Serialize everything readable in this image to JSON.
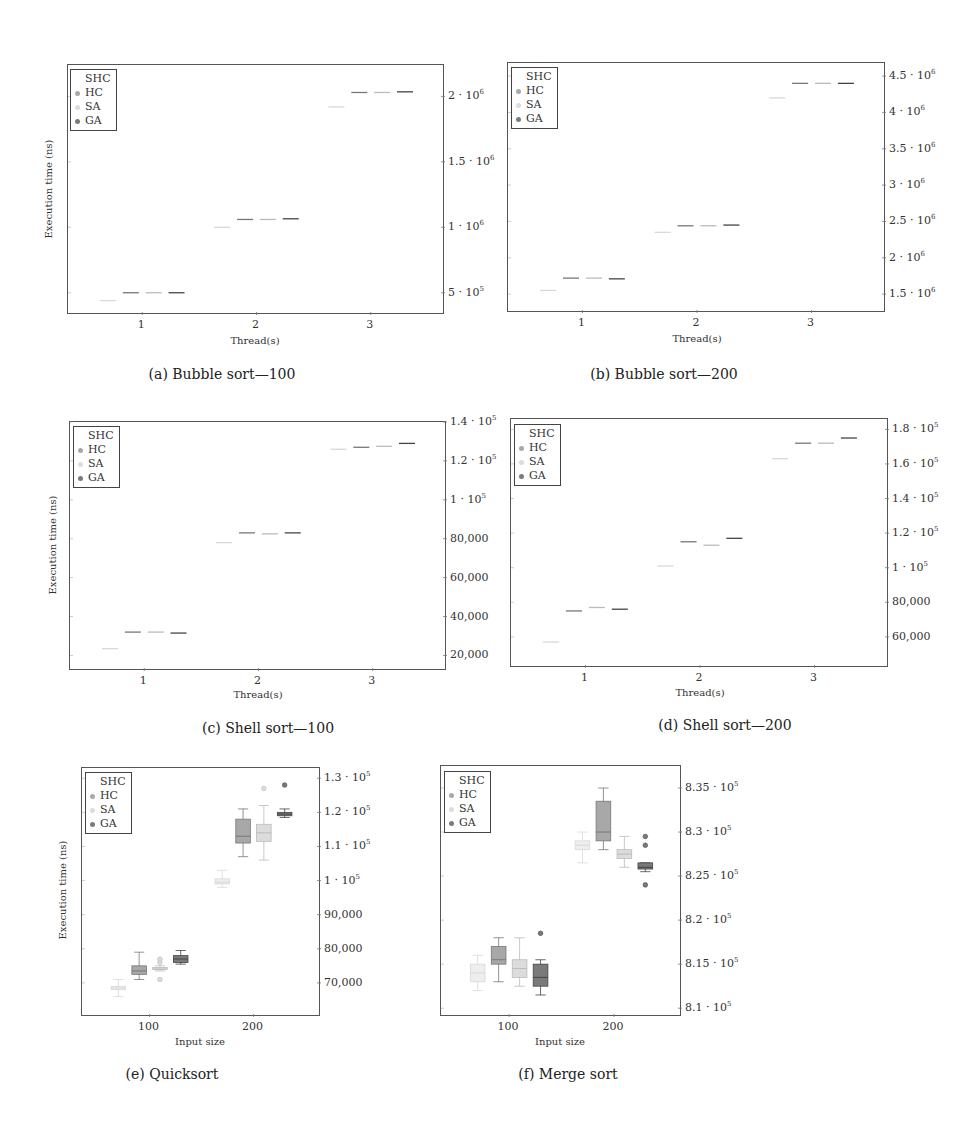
{
  "legend": {
    "title": "SHC",
    "items": [
      {
        "label": "HC",
        "color": "#a8a8a8"
      },
      {
        "label": "SA",
        "color": "#dcdcdc"
      },
      {
        "label": "GA",
        "color": "#7a7a7a"
      }
    ]
  },
  "shc_color": "#eeeeee",
  "chart_data": [
    {
      "id": "a",
      "type": "box",
      "caption": "(a) Bubble sort—100",
      "xlabel": "Thread(s)",
      "ylabel": "Execution time (ns)",
      "categories": [
        "1",
        "2",
        "3"
      ],
      "yticks": [
        {
          "v": 500000,
          "label": "5 · 10",
          "exp": "5"
        },
        {
          "v": 1000000,
          "label": "1 · 10",
          "exp": "6"
        },
        {
          "v": 1500000,
          "label": "1.5 · 10",
          "exp": "6"
        },
        {
          "v": 2000000,
          "label": "2 · 10",
          "exp": "6"
        }
      ],
      "ylim": [
        330000,
        2240000
      ],
      "legend_position": "top-left",
      "series": [
        {
          "name": "SHC",
          "medians": [
            440000,
            1000000,
            1920000
          ]
        },
        {
          "name": "HC",
          "medians": [
            500000,
            1060000,
            2030000
          ]
        },
        {
          "name": "SA",
          "medians": [
            500000,
            1060000,
            2030000
          ]
        },
        {
          "name": "GA",
          "medians": [
            500000,
            1065000,
            2035000
          ]
        }
      ]
    },
    {
      "id": "b",
      "type": "box",
      "caption": "(b) Bubble sort—200",
      "xlabel": "Thread(s)",
      "ylabel": "",
      "categories": [
        "1",
        "2",
        "3"
      ],
      "yticks": [
        {
          "v": 1500000,
          "label": "1.5 · 10",
          "exp": "6"
        },
        {
          "v": 2000000,
          "label": "2 · 10",
          "exp": "6"
        },
        {
          "v": 2500000,
          "label": "2.5 · 10",
          "exp": "6"
        },
        {
          "v": 3000000,
          "label": "3 · 10",
          "exp": "6"
        },
        {
          "v": 3500000,
          "label": "3.5 · 10",
          "exp": "6"
        },
        {
          "v": 4000000,
          "label": "4 · 10",
          "exp": "6"
        },
        {
          "v": 4500000,
          "label": "4.5 · 10",
          "exp": "6"
        }
      ],
      "ylim": [
        1240000,
        4680000
      ],
      "legend_position": "top-left",
      "series": [
        {
          "name": "SHC",
          "medians": [
            1550000,
            2350000,
            4200000
          ]
        },
        {
          "name": "HC",
          "medians": [
            1720000,
            2440000,
            4400000
          ]
        },
        {
          "name": "SA",
          "medians": [
            1720000,
            2440000,
            4400000
          ]
        },
        {
          "name": "GA",
          "medians": [
            1710000,
            2450000,
            4400000
          ]
        }
      ]
    },
    {
      "id": "c",
      "type": "box",
      "caption": "(c) Shell sort—100",
      "xlabel": "Thread(s)",
      "ylabel": "Execution time (ns)",
      "categories": [
        "1",
        "2",
        "3"
      ],
      "yticks": [
        {
          "v": 20000,
          "label": "20,000",
          "exp": ""
        },
        {
          "v": 40000,
          "label": "40,000",
          "exp": ""
        },
        {
          "v": 60000,
          "label": "60,000",
          "exp": ""
        },
        {
          "v": 80000,
          "label": "80,000",
          "exp": ""
        },
        {
          "v": 100000,
          "label": "1 · 10",
          "exp": "5"
        },
        {
          "v": 120000,
          "label": "1.2 · 10",
          "exp": "5"
        },
        {
          "v": 140000,
          "label": "1.4 · 10",
          "exp": "5"
        }
      ],
      "ylim": [
        12000,
        140000
      ],
      "legend_position": "top-left",
      "series": [
        {
          "name": "SHC",
          "medians": [
            23500,
            78000,
            126000
          ]
        },
        {
          "name": "HC",
          "medians": [
            32000,
            83000,
            127000
          ]
        },
        {
          "name": "SA",
          "medians": [
            32000,
            82500,
            127500
          ]
        },
        {
          "name": "GA",
          "medians": [
            31500,
            83000,
            129000
          ]
        }
      ]
    },
    {
      "id": "d",
      "type": "box",
      "caption": "(d) Shell sort—200",
      "xlabel": "Thread(s)",
      "ylabel": "",
      "categories": [
        "1",
        "2",
        "3"
      ],
      "yticks": [
        {
          "v": 60000,
          "label": "60,000",
          "exp": ""
        },
        {
          "v": 80000,
          "label": "80,000",
          "exp": ""
        },
        {
          "v": 100000,
          "label": "1 · 10",
          "exp": "5"
        },
        {
          "v": 120000,
          "label": "1.2 · 10",
          "exp": "5"
        },
        {
          "v": 140000,
          "label": "1.4 · 10",
          "exp": "5"
        },
        {
          "v": 160000,
          "label": "1.6 · 10",
          "exp": "5"
        },
        {
          "v": 180000,
          "label": "1.8 · 10",
          "exp": "5"
        }
      ],
      "ylim": [
        42000,
        186000
      ],
      "legend_position": "top-left",
      "series": [
        {
          "name": "SHC",
          "medians": [
            57000,
            101000,
            163000
          ]
        },
        {
          "name": "HC",
          "medians": [
            75000,
            115000,
            172000
          ]
        },
        {
          "name": "SA",
          "medians": [
            77000,
            113000,
            172000
          ]
        },
        {
          "name": "GA",
          "medians": [
            76000,
            117000,
            175000
          ]
        }
      ]
    },
    {
      "id": "e",
      "type": "box",
      "caption": "(e) Quicksort",
      "xlabel": "Input size",
      "ylabel": "Execution time (ns)",
      "categories": [
        "100",
        "200"
      ],
      "yticks": [
        {
          "v": 70000,
          "label": "70,000",
          "exp": ""
        },
        {
          "v": 80000,
          "label": "80,000",
          "exp": ""
        },
        {
          "v": 90000,
          "label": "90,000",
          "exp": ""
        },
        {
          "v": 100000,
          "label": "1 · 10",
          "exp": "5"
        },
        {
          "v": 110000,
          "label": "1.1 · 10",
          "exp": "5"
        },
        {
          "v": 120000,
          "label": "1.2 · 10",
          "exp": "5"
        },
        {
          "v": 130000,
          "label": "1.3 · 10",
          "exp": "5"
        }
      ],
      "ylim": [
        60000,
        133000
      ],
      "legend_position": "top-left",
      "series": [
        {
          "name": "SHC",
          "boxes": [
            {
              "min": 66000,
              "q1": 68000,
              "med": 68500,
              "q3": 69000,
              "max": 71000
            },
            {
              "min": 98000,
              "q1": 99000,
              "med": 99500,
              "q3": 100500,
              "max": 103000
            }
          ]
        },
        {
          "name": "HC",
          "boxes": [
            {
              "min": 71000,
              "q1": 72500,
              "med": 73500,
              "q3": 75000,
              "max": 79000
            },
            {
              "min": 107000,
              "q1": 111000,
              "med": 113000,
              "q3": 118000,
              "max": 121000
            }
          ]
        },
        {
          "name": "SA",
          "boxes": [
            {
              "min": 73500,
              "q1": 74000,
              "med": 74000,
              "q3": 74500,
              "max": 75000,
              "outliers": [
                71000,
                76000,
                77000
              ]
            },
            {
              "min": 106000,
              "q1": 111500,
              "med": 114000,
              "q3": 116500,
              "max": 122000,
              "outliers": [
                127000
              ]
            }
          ]
        },
        {
          "name": "GA",
          "boxes": [
            {
              "min": 75500,
              "q1": 76000,
              "med": 77000,
              "q3": 78000,
              "max": 79500
            },
            {
              "min": 118500,
              "q1": 119000,
              "med": 119500,
              "q3": 120000,
              "max": 121000,
              "outliers": [
                128000
              ]
            }
          ]
        }
      ]
    },
    {
      "id": "f",
      "type": "box",
      "caption": "(f) Merge sort",
      "xlabel": "Input size",
      "ylabel": "",
      "categories": [
        "100",
        "200"
      ],
      "yticks": [
        {
          "v": 810000,
          "label": "8.1 · 10",
          "exp": "5"
        },
        {
          "v": 815000,
          "label": "8.15 · 10",
          "exp": "5"
        },
        {
          "v": 820000,
          "label": "8.2 · 10",
          "exp": "5"
        },
        {
          "v": 825000,
          "label": "8.25 · 10",
          "exp": "5"
        },
        {
          "v": 830000,
          "label": "8.3 · 10",
          "exp": "5"
        },
        {
          "v": 835000,
          "label": "8.35 · 10",
          "exp": "5"
        }
      ],
      "ylim": [
        809000,
        837500
      ],
      "legend_position": "top-left",
      "series": [
        {
          "name": "SHC",
          "boxes": [
            {
              "min": 812000,
              "q1": 813000,
              "med": 814000,
              "q3": 815000,
              "max": 816000
            },
            {
              "min": 826500,
              "q1": 828000,
              "med": 828500,
              "q3": 829000,
              "max": 830000
            }
          ]
        },
        {
          "name": "HC",
          "boxes": [
            {
              "min": 813000,
              "q1": 815000,
              "med": 815500,
              "q3": 817000,
              "max": 818000
            },
            {
              "min": 828000,
              "q1": 829000,
              "med": 830000,
              "q3": 833500,
              "max": 835000
            }
          ]
        },
        {
          "name": "SA",
          "boxes": [
            {
              "min": 812500,
              "q1": 813500,
              "med": 814500,
              "q3": 815500,
              "max": 818000
            },
            {
              "min": 826000,
              "q1": 827000,
              "med": 827500,
              "q3": 828000,
              "max": 829500
            }
          ]
        },
        {
          "name": "GA",
          "boxes": [
            {
              "min": 811500,
              "q1": 812500,
              "med": 813500,
              "q3": 815000,
              "max": 815500,
              "outliers": [
                818500
              ]
            },
            {
              "min": 825500,
              "q1": 825800,
              "med": 826000,
              "q3": 826500,
              "max": 826500,
              "outliers": [
                824000,
                828500,
                829500
              ]
            }
          ]
        }
      ]
    }
  ]
}
